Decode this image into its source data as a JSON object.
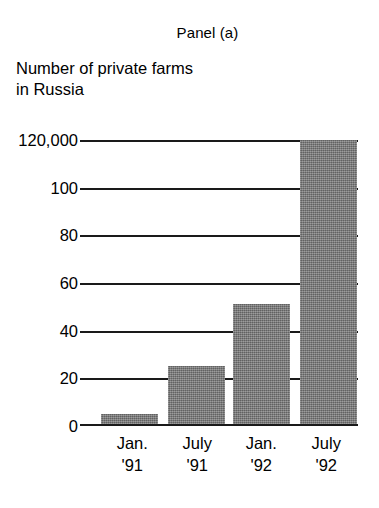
{
  "figure": {
    "panel_label": "Panel (a)",
    "subtitle": "Number of private farms\nin Russia"
  },
  "chart_data": {
    "type": "bar",
    "title": "Panel (a)",
    "subtitle": "Number of private farms in Russia",
    "xlabel": "",
    "ylabel": "",
    "unit_note": "Top axis label reads 120,000; remaining labels are in thousands",
    "categories": [
      "Jan. '91",
      "July '91",
      "Jan. '92",
      "July '92"
    ],
    "category_lines": [
      [
        "Jan.",
        "'91"
      ],
      [
        "July",
        "'91"
      ],
      [
        "Jan.",
        "'92"
      ],
      [
        "July",
        "'92"
      ]
    ],
    "values": [
      5,
      25,
      51,
      120
    ],
    "value_labels": [
      "5,000",
      "25,000",
      "51,000",
      "120,000"
    ],
    "ylim": [
      0,
      120
    ],
    "yticks": [
      0,
      20,
      40,
      60,
      80,
      100,
      120
    ],
    "ytick_labels": [
      "0",
      "20",
      "40",
      "60",
      "80",
      "100",
      "120,000"
    ],
    "grid": true,
    "legend": false,
    "bar_color": "#777777",
    "axis_color": "#1a1a1a"
  }
}
